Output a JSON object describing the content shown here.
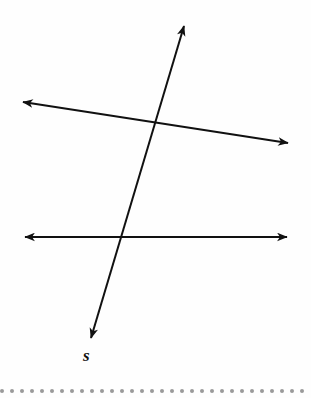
{
  "figure": {
    "background_color": "#fefefe",
    "stroke_color": "#111111",
    "width": 311,
    "height": 398
  },
  "labels": {
    "transversal": "s"
  },
  "ghost_text": "",
  "chart_data": {
    "type": "diagram",
    "xlabel": "",
    "ylabel": "",
    "coordinate_space": {
      "width": 311,
      "height": 398,
      "origin": "top-left"
    },
    "elements": [
      {
        "id": "upper-line",
        "name": "upper-slanted-line",
        "kind": "double-headed-arrow-line",
        "x1": 23,
        "y1": 102,
        "x2": 288,
        "y2": 143,
        "arrow_start": true,
        "arrow_end": true,
        "stroke": "#111111",
        "stroke_width": 2,
        "label": ""
      },
      {
        "id": "lower-line",
        "name": "lower-horizontal-line",
        "kind": "double-headed-arrow-line",
        "x1": 25,
        "y1": 237,
        "x2": 287,
        "y2": 237,
        "arrow_start": true,
        "arrow_end": true,
        "stroke": "#111111",
        "stroke_width": 2,
        "label": ""
      },
      {
        "id": "transversal-line",
        "name": "transversal-line-s",
        "kind": "double-headed-arrow-line",
        "x1": 91,
        "y1": 338,
        "x2": 184,
        "y2": 26,
        "arrow_start": true,
        "arrow_end": true,
        "stroke": "#111111",
        "stroke_width": 2,
        "label": "s"
      }
    ],
    "intersections": [
      {
        "id": "upper-intersection",
        "x": 153,
        "y": 128,
        "lines": [
          "upper-line",
          "transversal-line"
        ]
      },
      {
        "id": "lower-intersection",
        "x": 119,
        "y": 237,
        "lines": [
          "lower-line",
          "transversal-line"
        ]
      }
    ],
    "annotations": [
      {
        "id": "label-s",
        "text": "s",
        "x": 88,
        "y": 356,
        "style": "italic-bold"
      }
    ],
    "decorations": {
      "bottom_dot_rule": {
        "count": 31,
        "dot_diameter": 4,
        "spacing": 10,
        "y": 390,
        "color": "#9a9a9a"
      }
    }
  }
}
